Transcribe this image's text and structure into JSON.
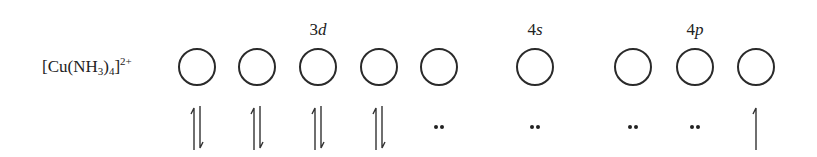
{
  "diagram": {
    "complex_label": {
      "prefix": "[Cu(NH",
      "sub1": "3",
      "mid": ")",
      "sub2": "4",
      "close": "]",
      "charge": "2+"
    },
    "subshell_labels": [
      {
        "num": "3",
        "letter": "d",
        "x": 318
      },
      {
        "num": "4",
        "letter": "s",
        "x": 535
      },
      {
        "num": "4",
        "letter": "p",
        "x": 695
      }
    ],
    "orbitals": [
      {
        "subshell": "3d",
        "x": 197,
        "occupancy": "paired"
      },
      {
        "subshell": "3d",
        "x": 257,
        "occupancy": "paired"
      },
      {
        "subshell": "3d",
        "x": 318,
        "occupancy": "paired"
      },
      {
        "subshell": "3d",
        "x": 379,
        "occupancy": "paired"
      },
      {
        "subshell": "3d",
        "x": 439,
        "occupancy": "ligand-pair"
      },
      {
        "subshell": "4s",
        "x": 535,
        "occupancy": "ligand-pair"
      },
      {
        "subshell": "4p",
        "x": 633,
        "occupancy": "ligand-pair"
      },
      {
        "subshell": "4p",
        "x": 695,
        "occupancy": "ligand-pair"
      },
      {
        "subshell": "4p",
        "x": 756,
        "occupancy": "single-up"
      }
    ]
  }
}
